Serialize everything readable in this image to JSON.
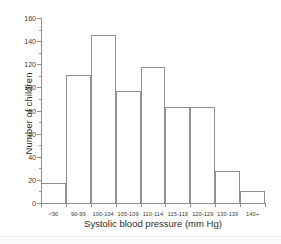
{
  "chart_data": {
    "type": "bar",
    "title": "",
    "xlabel": "Systolic blood pressure (mm Hg)",
    "ylabel": "Number of children",
    "categories": [
      "<90",
      "90-99",
      "100-104",
      "105-109",
      "110-114",
      "115-119",
      "120-129",
      "130-139",
      "140+"
    ],
    "values": [
      17,
      111,
      145,
      97,
      118,
      83,
      83,
      28,
      10
    ],
    "ylim": [
      0,
      160
    ],
    "ytick_labels": [
      "0",
      "20",
      "40",
      "60",
      "80",
      "100",
      "120",
      "140",
      "160"
    ],
    "ytick_values": [
      0,
      20,
      40,
      60,
      80,
      100,
      120,
      140,
      160
    ],
    "yminor_step": 10,
    "grid": false,
    "legend": null,
    "bar_edge_color": "#909090",
    "bar_fill_color": "#ffffff",
    "axis_color": "#8d8d8d",
    "background_color": "#ffffff"
  }
}
